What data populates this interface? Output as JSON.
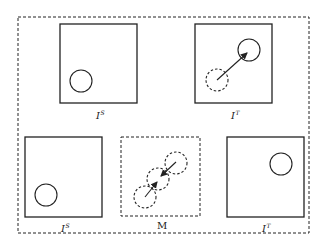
{
  "diagram": {
    "colors": {
      "stroke": "#222222",
      "background": "#ffffff"
    },
    "outer_frame": {
      "style": "dashed",
      "x": 18,
      "y": 17,
      "w": 291,
      "h": 216
    },
    "panels": [
      {
        "id": "top-source",
        "label_base": "I",
        "label_sup": "S",
        "box": {
          "x": 60,
          "y": 24,
          "w": 77,
          "h": 79,
          "style": "solid"
        },
        "circles": [
          {
            "cx": 81,
            "cy": 81,
            "r": 11,
            "style": "solid"
          }
        ],
        "arrows": [],
        "label_pos": {
          "x": 96,
          "y": 119
        }
      },
      {
        "id": "top-target",
        "label_base": "I",
        "label_sup": "T",
        "box": {
          "x": 195,
          "y": 24,
          "w": 77,
          "h": 79,
          "style": "solid"
        },
        "circles": [
          {
            "cx": 249,
            "cy": 50,
            "r": 11,
            "style": "solid"
          },
          {
            "cx": 217,
            "cy": 80,
            "r": 11,
            "style": "dashed"
          }
        ],
        "arrows": [
          {
            "x1": 217,
            "y1": 80,
            "x2": 247,
            "y2": 53
          }
        ],
        "label_pos": {
          "x": 231,
          "y": 119
        }
      },
      {
        "id": "bottom-source",
        "label_base": "I",
        "label_sup": "S",
        "box": {
          "x": 25,
          "y": 137,
          "w": 77,
          "h": 80,
          "style": "solid"
        },
        "circles": [
          {
            "cx": 46,
            "cy": 195,
            "r": 11,
            "style": "solid"
          }
        ],
        "arrows": [],
        "label_pos": {
          "x": 61,
          "y": 232
        }
      },
      {
        "id": "motion",
        "label_base": "M",
        "label_sup": "",
        "box": {
          "x": 121,
          "y": 137,
          "w": 79,
          "h": 79,
          "style": "dashed"
        },
        "circles": [
          {
            "cx": 145,
            "cy": 197,
            "r": 11,
            "style": "dashed"
          },
          {
            "cx": 158,
            "cy": 179,
            "r": 11,
            "style": "dashed"
          },
          {
            "cx": 176,
            "cy": 163,
            "r": 11,
            "style": "dashed"
          }
        ],
        "arrows": [
          {
            "x1": 145,
            "y1": 197,
            "x2": 157,
            "y2": 182
          },
          {
            "x1": 176,
            "y1": 162,
            "x2": 161,
            "y2": 176
          }
        ],
        "label_pos": {
          "x": 157,
          "y": 229
        }
      },
      {
        "id": "bottom-target",
        "label_base": "I",
        "label_sup": "T",
        "box": {
          "x": 227,
          "y": 137,
          "w": 77,
          "h": 80,
          "style": "solid"
        },
        "circles": [
          {
            "cx": 281,
            "cy": 164,
            "r": 11,
            "style": "solid"
          }
        ],
        "arrows": [],
        "label_pos": {
          "x": 262,
          "y": 232
        }
      }
    ]
  }
}
